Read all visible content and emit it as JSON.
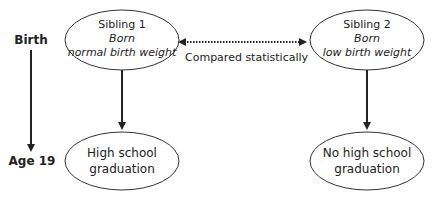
{
  "timeline": {
    "start_label": "Birth",
    "end_label": "Age 19"
  },
  "nodes": {
    "sibling1": {
      "title": "Sibling 1",
      "line2": "Born",
      "line3": "normal birth weight"
    },
    "sibling2": {
      "title": "Sibling 2",
      "line2": "Born",
      "line3": "low birth weight"
    },
    "outcome1": {
      "line1": "High school",
      "line2": "graduation"
    },
    "outcome2": {
      "line1": "No high school",
      "line2": "graduation"
    }
  },
  "comparison": {
    "label": "Compared statistically"
  },
  "colors": {
    "stroke": "#222222",
    "text": "#222222",
    "background": "#ffffff"
  }
}
